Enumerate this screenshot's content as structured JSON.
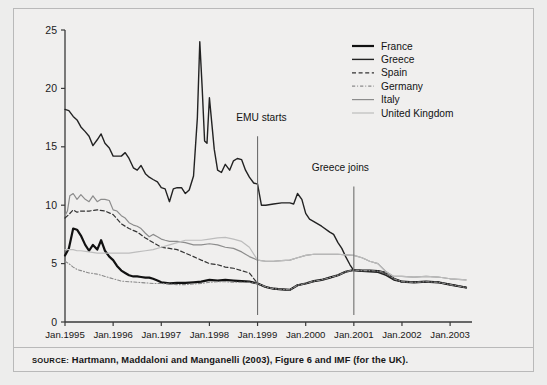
{
  "figure": {
    "source_prefix": "SOURCE:",
    "source_text": "Hartmann, Maddaloni and Manganelli (2003), Figure 6 and IMF (for the UK)."
  },
  "colors": {
    "france": "#111111",
    "greece": "#222222",
    "spain": "#333333",
    "germany": "#8a8a8a",
    "italy": "#8c8c8c",
    "united_kingdom": "#bdbdbd",
    "axis": "#3a3a3a",
    "frame": "#b9b9b9",
    "background": "#f0efee"
  },
  "chart_data": {
    "type": "line",
    "title": "",
    "xlabel": "",
    "ylabel": "",
    "grid": false,
    "legend_position": "top-right",
    "ylim": [
      0,
      25
    ],
    "yticks": [
      0,
      5,
      10,
      15,
      20,
      25
    ],
    "xticks": [
      "Jan.1995",
      "Jan.1996",
      "Jan.1997",
      "Jan.1998",
      "Jan.1999",
      "Jan.2000",
      "Jan.2001",
      "Jan.2002",
      "Jan.2003"
    ],
    "x_start_year": 1995.0,
    "x_end_year": 2003.33,
    "annotations": [
      {
        "label": "EMU starts",
        "x": 1999.0,
        "text_x": 1999.08,
        "text_y": 17.2,
        "line_top_y": 15.9,
        "line_bottom_y": 0.6
      },
      {
        "label": "Greece joins",
        "x": 2001.0,
        "text_x": 2000.72,
        "text_y": 12.9,
        "line_top_y": 11.6,
        "line_bottom_y": 0.6
      }
    ],
    "series": [
      {
        "name": "France",
        "style": "solid",
        "width": 2.2,
        "color": "#111111",
        "x": [
          1995.0,
          1995.08,
          1995.17,
          1995.25,
          1995.33,
          1995.42,
          1995.5,
          1995.58,
          1995.67,
          1995.75,
          1995.83,
          1995.92,
          1996.0,
          1996.08,
          1996.17,
          1996.25,
          1996.33,
          1996.42,
          1996.5,
          1996.58,
          1996.67,
          1996.75,
          1996.83,
          1996.92,
          1997.0,
          1997.17,
          1997.33,
          1997.5,
          1997.67,
          1997.83,
          1998.0,
          1998.17,
          1998.33,
          1998.5,
          1998.67,
          1998.83,
          1999.0,
          1999.17,
          1999.33,
          1999.5,
          1999.67,
          1999.83,
          2000.0,
          2000.17,
          2000.33,
          2000.5,
          2000.67,
          2000.83,
          2001.0,
          2001.17,
          2001.33,
          2001.5,
          2001.67,
          2001.83,
          2002.0,
          2002.25,
          2002.5,
          2002.75,
          2003.0,
          2003.33
        ],
        "y": [
          5.7,
          6.3,
          8.0,
          7.9,
          7.4,
          6.6,
          6.1,
          6.6,
          6.2,
          7.0,
          6.1,
          5.6,
          5.3,
          4.8,
          4.4,
          4.2,
          4.0,
          3.9,
          3.9,
          3.85,
          3.8,
          3.8,
          3.7,
          3.55,
          3.4,
          3.3,
          3.35,
          3.35,
          3.4,
          3.45,
          3.6,
          3.55,
          3.6,
          3.55,
          3.5,
          3.45,
          3.3,
          3.0,
          2.85,
          2.8,
          2.75,
          3.15,
          3.3,
          3.5,
          3.6,
          3.8,
          4.0,
          4.3,
          4.45,
          4.4,
          4.4,
          4.35,
          4.2,
          3.7,
          3.45,
          3.4,
          3.45,
          3.4,
          3.2,
          2.95
        ]
      },
      {
        "name": "Greece",
        "style": "solid",
        "width": 1.4,
        "color": "#222222",
        "x": [
          1995.0,
          1995.08,
          1995.17,
          1995.25,
          1995.33,
          1995.42,
          1995.5,
          1995.58,
          1995.67,
          1995.75,
          1995.83,
          1995.92,
          1996.0,
          1996.08,
          1996.17,
          1996.25,
          1996.33,
          1996.42,
          1996.5,
          1996.58,
          1996.67,
          1996.75,
          1996.83,
          1996.92,
          1997.0,
          1997.08,
          1997.17,
          1997.25,
          1997.33,
          1997.42,
          1997.5,
          1997.58,
          1997.67,
          1997.75,
          1997.8,
          1997.85,
          1997.9,
          1997.95,
          1998.0,
          1998.05,
          1998.1,
          1998.17,
          1998.25,
          1998.33,
          1998.42,
          1998.5,
          1998.58,
          1998.67,
          1998.75,
          1998.83,
          1998.92,
          1999.0,
          1999.08,
          1999.17,
          1999.33,
          1999.5,
          1999.67,
          1999.75,
          1999.83,
          1999.92,
          2000.0,
          2000.08,
          2000.17,
          2000.33,
          2000.5,
          2000.58,
          2000.67,
          2000.75,
          2000.83,
          2000.92,
          2001.0,
          2001.17,
          2001.33,
          2001.5,
          2001.67,
          2001.83,
          2002.0,
          2002.25,
          2002.5,
          2002.75,
          2003.0,
          2003.33
        ],
        "y": [
          18.2,
          18.1,
          17.6,
          17.3,
          16.7,
          16.3,
          15.9,
          15.1,
          15.6,
          16.1,
          15.3,
          14.9,
          14.2,
          14.2,
          14.2,
          14.5,
          14.0,
          13.2,
          13.0,
          13.4,
          12.7,
          12.4,
          12.2,
          12.0,
          11.5,
          11.4,
          10.3,
          11.4,
          11.5,
          11.5,
          11.0,
          11.3,
          12.5,
          17.5,
          24.0,
          20.0,
          15.5,
          15.3,
          19.2,
          17.0,
          14.8,
          13.0,
          12.8,
          13.5,
          13.0,
          13.8,
          14.0,
          13.9,
          13.0,
          12.4,
          11.9,
          11.8,
          10.0,
          10.0,
          10.1,
          10.2,
          10.2,
          10.1,
          11.0,
          10.5,
          9.3,
          8.8,
          8.6,
          8.2,
          7.7,
          7.5,
          6.8,
          6.3,
          5.6,
          4.9,
          4.4,
          4.35,
          4.3,
          4.25,
          4.0,
          3.6,
          3.45,
          3.4,
          3.45,
          3.4,
          3.2,
          2.95
        ]
      },
      {
        "name": "Spain",
        "style": "dashed",
        "width": 1.2,
        "color": "#333333",
        "x": [
          1995.0,
          1995.08,
          1995.17,
          1995.25,
          1995.33,
          1995.5,
          1995.67,
          1995.83,
          1996.0,
          1996.17,
          1996.33,
          1996.5,
          1996.67,
          1996.83,
          1997.0,
          1997.17,
          1997.33,
          1997.5,
          1997.67,
          1997.83,
          1998.0,
          1998.17,
          1998.33,
          1998.5,
          1998.67,
          1998.83,
          1999.0,
          1999.17,
          1999.33,
          1999.5,
          1999.67,
          1999.83,
          2000.0,
          2000.17,
          2000.33,
          2000.5,
          2000.67,
          2000.83,
          2001.0,
          2001.17,
          2001.33,
          2001.5,
          2001.67,
          2001.83,
          2002.0,
          2002.25,
          2002.5,
          2002.75,
          2003.0,
          2003.33
        ],
        "y": [
          8.9,
          9.2,
          9.6,
          9.4,
          9.5,
          9.5,
          9.6,
          9.5,
          9.2,
          8.4,
          8.0,
          7.7,
          7.2,
          6.8,
          6.4,
          6.3,
          6.2,
          5.9,
          5.6,
          5.3,
          5.0,
          4.9,
          4.7,
          4.6,
          4.4,
          4.2,
          3.3,
          3.0,
          2.85,
          2.8,
          2.75,
          3.15,
          3.3,
          3.5,
          3.6,
          3.8,
          4.0,
          4.3,
          4.45,
          4.4,
          4.4,
          4.35,
          4.2,
          3.7,
          3.45,
          3.4,
          3.45,
          3.4,
          3.2,
          2.95
        ]
      },
      {
        "name": "Germany",
        "style": "dash-dot",
        "width": 1.1,
        "color": "#8a8a8a",
        "x": [
          1995.0,
          1995.08,
          1995.17,
          1995.25,
          1995.33,
          1995.5,
          1995.67,
          1995.83,
          1996.0,
          1996.17,
          1996.33,
          1996.5,
          1996.67,
          1996.83,
          1997.0,
          1997.17,
          1997.33,
          1997.5,
          1997.67,
          1997.83,
          1998.0,
          1998.17,
          1998.33,
          1998.5,
          1998.67,
          1998.83,
          1999.0,
          1999.17,
          1999.33,
          1999.5,
          1999.67,
          1999.83,
          2000.0,
          2000.17,
          2000.33,
          2000.5,
          2000.67,
          2000.83,
          2001.0,
          2001.17,
          2001.33,
          2001.5,
          2001.67,
          2001.83,
          2002.0,
          2002.25,
          2002.5,
          2002.75,
          2003.0,
          2003.33
        ],
        "y": [
          5.2,
          5.0,
          4.7,
          4.5,
          4.4,
          4.2,
          4.1,
          3.9,
          3.7,
          3.5,
          3.45,
          3.4,
          3.35,
          3.3,
          3.3,
          3.25,
          3.2,
          3.2,
          3.25,
          3.3,
          3.4,
          3.45,
          3.45,
          3.4,
          3.4,
          3.4,
          3.3,
          3.0,
          2.85,
          2.8,
          2.75,
          3.15,
          3.3,
          3.5,
          3.6,
          3.8,
          4.0,
          4.3,
          4.45,
          4.4,
          4.4,
          4.35,
          4.2,
          3.7,
          3.45,
          3.4,
          3.45,
          3.4,
          3.2,
          2.95
        ]
      },
      {
        "name": "Italy",
        "style": "solid",
        "width": 1.2,
        "color": "#8c8c8c",
        "x": [
          1995.0,
          1995.05,
          1995.1,
          1995.17,
          1995.25,
          1995.33,
          1995.42,
          1995.5,
          1995.58,
          1995.67,
          1995.75,
          1995.83,
          1995.92,
          1996.0,
          1996.08,
          1996.17,
          1996.25,
          1996.33,
          1996.42,
          1996.5,
          1996.58,
          1996.67,
          1996.75,
          1996.83,
          1996.92,
          1997.0,
          1997.08,
          1997.17,
          1997.33,
          1997.5,
          1997.67,
          1997.83,
          1998.0,
          1998.17,
          1998.33,
          1998.5,
          1998.67,
          1998.83,
          1999.0,
          1999.17,
          1999.33,
          1999.5,
          1999.67,
          1999.83,
          2000.0,
          2000.17,
          2000.33,
          2000.5,
          2000.67,
          2000.83,
          2001.0,
          2001.17,
          2001.33,
          2001.5,
          2001.67,
          2001.83,
          2002.0,
          2002.25,
          2002.5,
          2002.75,
          2003.0,
          2003.33
        ],
        "y": [
          9.1,
          9.5,
          10.8,
          11.0,
          10.5,
          10.9,
          10.5,
          10.3,
          10.8,
          10.3,
          10.5,
          10.5,
          10.4,
          9.6,
          9.5,
          9.1,
          8.9,
          8.5,
          8.3,
          8.2,
          8.0,
          7.6,
          7.3,
          7.5,
          7.3,
          7.1,
          7.0,
          6.9,
          6.9,
          6.8,
          6.6,
          6.6,
          6.7,
          6.6,
          6.4,
          6.3,
          6.0,
          5.6,
          5.3,
          5.2,
          5.2,
          5.25,
          5.3,
          5.5,
          5.7,
          5.8,
          5.8,
          5.8,
          5.8,
          5.75,
          5.7,
          5.5,
          5.2,
          5.0,
          4.3,
          3.9,
          3.9,
          3.85,
          3.9,
          3.85,
          3.7,
          3.6
        ]
      },
      {
        "name": "United Kingdom",
        "style": "solid",
        "width": 1.2,
        "color": "#bdbdbd",
        "x": [
          1995.0,
          1995.08,
          1995.17,
          1995.25,
          1995.33,
          1995.5,
          1995.67,
          1995.83,
          1996.0,
          1996.17,
          1996.33,
          1996.5,
          1996.67,
          1996.83,
          1997.0,
          1997.17,
          1997.33,
          1997.5,
          1997.67,
          1997.83,
          1998.0,
          1998.17,
          1998.33,
          1998.5,
          1998.67,
          1998.83,
          1999.0,
          1999.17,
          1999.33,
          1999.5,
          1999.67,
          1999.83,
          2000.0,
          2000.17,
          2000.33,
          2000.5,
          2000.67,
          2000.83,
          2001.0,
          2001.17,
          2001.33,
          2001.5,
          2001.67,
          2001.83,
          2002.0,
          2002.25,
          2002.5,
          2002.75,
          2003.0,
          2003.33
        ],
        "y": [
          6.2,
          6.2,
          6.2,
          6.1,
          6.1,
          6.0,
          5.9,
          5.9,
          5.9,
          5.9,
          5.9,
          6.0,
          6.1,
          6.2,
          6.4,
          6.6,
          6.8,
          7.0,
          7.0,
          7.0,
          7.1,
          7.2,
          7.25,
          7.1,
          6.9,
          6.4,
          5.3,
          5.2,
          5.2,
          5.25,
          5.3,
          5.5,
          5.7,
          5.8,
          5.8,
          5.8,
          5.8,
          5.75,
          5.7,
          5.5,
          5.2,
          5.0,
          4.3,
          3.9,
          3.9,
          3.85,
          3.9,
          3.85,
          3.7,
          3.6
        ]
      }
    ]
  }
}
